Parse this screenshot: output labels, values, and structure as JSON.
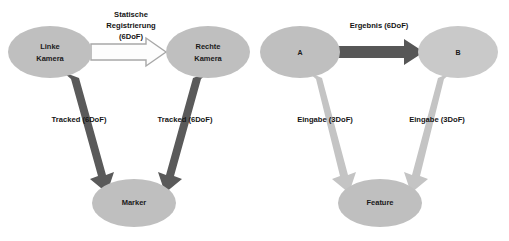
{
  "diagram": {
    "background": "#ffffff",
    "colors": {
      "node_fill": "#bfbfbf",
      "node_fill_light": "#c9c9c9",
      "arrow_dark": "#595959",
      "arrow_light": "#bfbfbf",
      "arrow_outline_fill": "#ffffff",
      "arrow_outline_stroke": "#aaaaaa",
      "text": "#151515"
    },
    "left_graph": {
      "nodes": [
        {
          "id": "linke-kamera",
          "label_line1": "Linke",
          "label_line2": "Kamera"
        },
        {
          "id": "rechte-kamera",
          "label_line1": "Rechte",
          "label_line2": "Kamera"
        },
        {
          "id": "marker",
          "label_line1": "Marker",
          "label_line2": ""
        }
      ],
      "edges": [
        {
          "id": "statische-registrierung",
          "from": "linke-kamera",
          "to": "rechte-kamera",
          "style": "outline",
          "label_line1": "Statische",
          "label_line2": "Registrierung",
          "label_line3": "(6DoF)"
        },
        {
          "id": "tracked-left",
          "from": "linke-kamera",
          "to": "marker",
          "style": "dark",
          "label_line1": "Tracked (6DoF)"
        },
        {
          "id": "tracked-right",
          "from": "rechte-kamera",
          "to": "marker",
          "style": "dark",
          "label_line1": "Tracked (6DoF)"
        }
      ]
    },
    "right_graph": {
      "nodes": [
        {
          "id": "a",
          "label_line1": "A",
          "label_line2": ""
        },
        {
          "id": "b",
          "label_line1": "B",
          "label_line2": ""
        },
        {
          "id": "feature",
          "label_line1": "Feature",
          "label_line2": ""
        }
      ],
      "edges": [
        {
          "id": "ergebnis",
          "from": "a",
          "to": "b",
          "style": "dark",
          "label_line1": "Ergebnis (6DoF)"
        },
        {
          "id": "eingabe-left",
          "from": "a",
          "to": "feature",
          "style": "light",
          "label_line1": "Eingabe (3DoF)"
        },
        {
          "id": "eingabe-right",
          "from": "b",
          "to": "feature",
          "style": "light",
          "label_line1": "Eingabe (3DoF)"
        }
      ]
    }
  }
}
